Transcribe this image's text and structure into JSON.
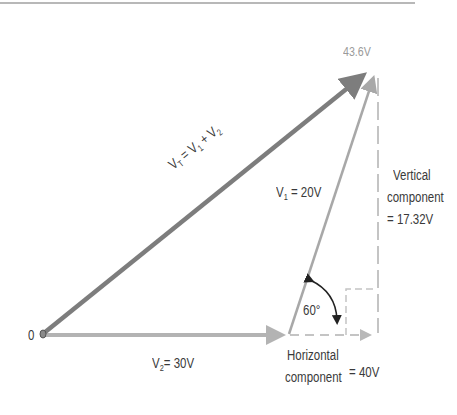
{
  "diagram": {
    "colors": {
      "resultant": "#7d7d7d",
      "v1": "#a8a8a8",
      "v2": "#b3b3b3",
      "dashed": "#c4c4c4",
      "text": "#3a3a3a",
      "text_light": "#9a9a9a",
      "angle_arc": "#222222"
    },
    "labels": {
      "origin": "0",
      "resultant_magnitude": "43.6V",
      "resultant_eq_prefix": "V",
      "resultant_eq_sub": "T",
      "resultant_eq_mid1": " = V",
      "resultant_eq_sub1": "1",
      "resultant_eq_mid2": " + V",
      "resultant_eq_sub2": "2",
      "v1_prefix": "V",
      "v1_sub": "1",
      "v1_value": " = 20V",
      "v2_prefix": "V",
      "v2_sub": "2",
      "v2_value": "= 30V",
      "angle": "60°",
      "vertical_line1": "Vertical",
      "vertical_line2": "component",
      "vertical_line3": "= 17.32V",
      "horizontal_line1": "Horizontal",
      "horizontal_line2": "component",
      "horizontal_value": "= 40V"
    },
    "vectors": [
      {
        "name": "V2",
        "magnitude": 30,
        "unit": "V",
        "angle_deg": 0
      },
      {
        "name": "V1",
        "magnitude": 20,
        "unit": "V",
        "angle_deg": 60
      },
      {
        "name": "VT",
        "magnitude": 43.6,
        "unit": "V",
        "horizontal_component": 40,
        "vertical_component": 17.32
      }
    ]
  }
}
